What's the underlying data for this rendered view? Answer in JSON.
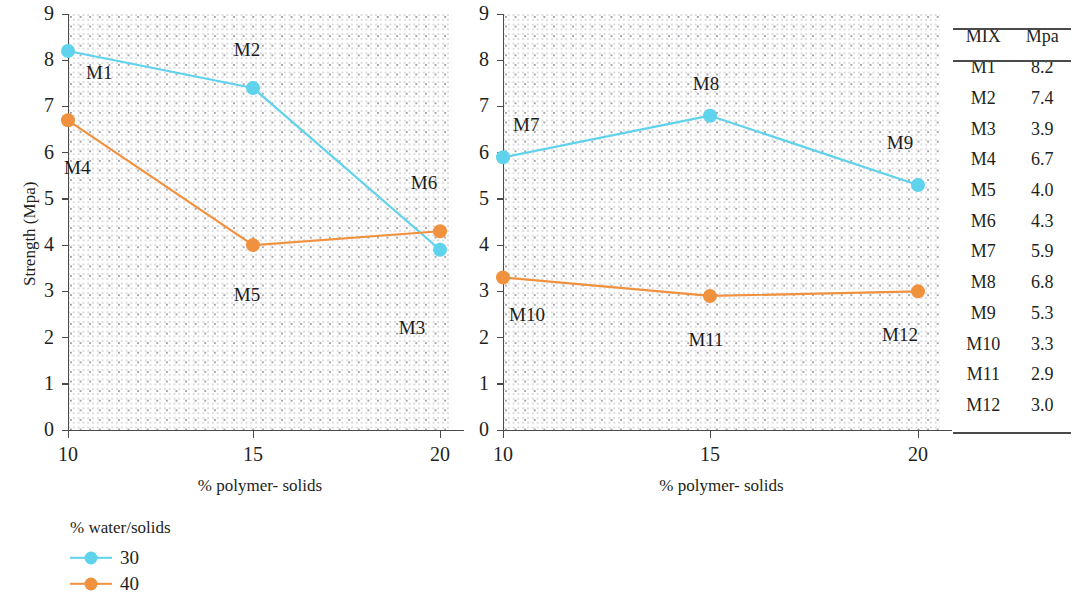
{
  "chart_data": [
    {
      "type": "line",
      "id": "chart-left",
      "title": "",
      "xlabel": "% polymer- solids",
      "ylabel": "Strength (Mpa)",
      "x": [
        10,
        15,
        20
      ],
      "xticks": [
        "10",
        "15",
        "20"
      ],
      "yticks": [
        "0",
        "1",
        "2",
        "3",
        "4",
        "5",
        "6",
        "7",
        "8",
        "9"
      ],
      "xlim": [
        10,
        20
      ],
      "ylim": [
        0,
        9
      ],
      "grid": "dotted",
      "series": [
        {
          "name": "30",
          "color": "#5fd2ec",
          "values": [
            8.2,
            7.4,
            3.9
          ],
          "point_labels": [
            "M1",
            "M2",
            "M3"
          ]
        },
        {
          "name": "40",
          "color": "#f0913e",
          "values": [
            6.7,
            4.0,
            4.3
          ],
          "point_labels": [
            "M4",
            "M5",
            "M6"
          ]
        }
      ]
    },
    {
      "type": "line",
      "id": "chart-right",
      "title": "",
      "xlabel": "% polymer- solids",
      "ylabel": "",
      "x": [
        10,
        15,
        20
      ],
      "xticks": [
        "10",
        "15",
        "20"
      ],
      "yticks": [
        "0",
        "1",
        "2",
        "3",
        "4",
        "5",
        "6",
        "7",
        "8",
        "9"
      ],
      "xlim": [
        10,
        20
      ],
      "ylim": [
        0,
        9
      ],
      "grid": "dotted",
      "series": [
        {
          "name": "30",
          "color": "#5fd2ec",
          "values": [
            5.9,
            6.8,
            5.3
          ],
          "point_labels": [
            "M7",
            "M8",
            "M9"
          ]
        },
        {
          "name": "40",
          "color": "#f0913e",
          "values": [
            3.3,
            2.9,
            3.0
          ],
          "point_labels": [
            "M10",
            "M11",
            "M12"
          ]
        }
      ]
    }
  ],
  "legend": {
    "title": "% water/solids",
    "position": "below-left",
    "entries": [
      {
        "label": "30",
        "color": "#5fd2ec"
      },
      {
        "label": "40",
        "color": "#f0913e"
      }
    ]
  },
  "table": {
    "headers": [
      "MIX",
      "Mpa"
    ],
    "rows": [
      [
        "M1",
        "8.2"
      ],
      [
        "M2",
        "7.4"
      ],
      [
        "M3",
        "3.9"
      ],
      [
        "M4",
        "6.7"
      ],
      [
        "M5",
        "4.0"
      ],
      [
        "M6",
        "4.3"
      ],
      [
        "M7",
        "5.9"
      ],
      [
        "M8",
        "6.8"
      ],
      [
        "M9",
        "5.3"
      ],
      [
        "M10",
        "3.3"
      ],
      [
        "M11",
        "2.9"
      ],
      [
        "M12",
        "3.0"
      ]
    ]
  }
}
